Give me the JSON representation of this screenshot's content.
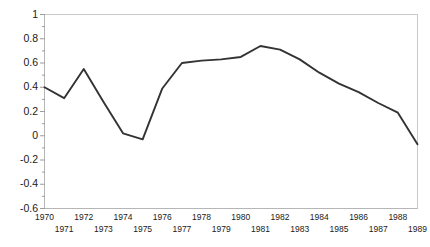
{
  "chart_data": {
    "type": "line",
    "title": "",
    "subtitle": "",
    "xlabel": "",
    "ylabel": "",
    "categories": [
      "1970",
      "1971",
      "1972",
      "1973",
      "1974",
      "1975",
      "1976",
      "1977",
      "1978",
      "1979",
      "1980",
      "1981",
      "1982",
      "1983",
      "1984",
      "1985",
      "1986",
      "1987",
      "1988",
      "1989"
    ],
    "values": [
      0.4,
      0.31,
      0.55,
      0.28,
      0.02,
      -0.03,
      0.39,
      0.6,
      0.62,
      0.63,
      0.65,
      0.74,
      0.71,
      0.63,
      0.52,
      0.43,
      0.36,
      0.27,
      0.19,
      -0.07
    ],
    "series": [
      {
        "name": "series-1",
        "values": [
          0.4,
          0.31,
          0.55,
          0.28,
          0.02,
          -0.03,
          0.39,
          0.6,
          0.62,
          0.63,
          0.65,
          0.74,
          0.71,
          0.63,
          0.52,
          0.43,
          0.36,
          0.27,
          0.19,
          -0.07
        ]
      }
    ],
    "ylim": [
      -0.6,
      1.0
    ],
    "xlim": [
      "1970",
      "1989"
    ],
    "yticks": [
      1,
      0.8,
      0.6,
      0.4,
      0.2,
      0,
      -0.2,
      -0.4,
      -0.6
    ],
    "ytick_labels": [
      "1",
      "0.8",
      "0.6",
      "0.4",
      "0.2",
      "0",
      "-0.2",
      "-0.4",
      "-0.6"
    ],
    "ytick_minor_count": 8,
    "xtick_labels_top_row": [
      "1970",
      "1972",
      "1974",
      "1976",
      "1978",
      "1980",
      "1982",
      "1984",
      "1986",
      "1988"
    ],
    "xtick_labels_bottom_row": [
      "1971",
      "1973",
      "1975",
      "1977",
      "1979",
      "1981",
      "1983",
      "1985",
      "1987",
      "1989"
    ],
    "grid": false,
    "legend": "none",
    "line_color": "#333333",
    "frame_color": "#c8c8c8",
    "axis_color": "#b4b4b4",
    "background_color": "#ffffff"
  }
}
